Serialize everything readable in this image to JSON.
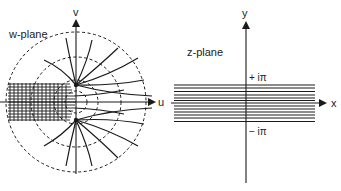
{
  "w_plane": {
    "title": "w-plane",
    "axis_horizontal_label": "u",
    "axis_vertical_label": "v",
    "origin": [
      76,
      102
    ],
    "circle_radii": [
      22,
      45,
      70
    ],
    "singular_points": [
      [
        76,
        85
      ],
      [
        76,
        120
      ]
    ],
    "strip": {
      "x0": 8,
      "x1": 74,
      "y0": 83,
      "y1": 121
    }
  },
  "z_plane": {
    "title": "z-plane",
    "axis_horizontal_label": "x",
    "axis_vertical_label": "y",
    "upper_bound_label": "+ iπ",
    "lower_bound_label": "− iπ",
    "origin": [
      246,
      103
    ],
    "strip": {
      "x0": 173,
      "x1": 315,
      "y0": 84,
      "y1": 122
    },
    "line_count": 13
  },
  "colors": {
    "ink": "#1a1a1a",
    "background": "#ffffff"
  }
}
